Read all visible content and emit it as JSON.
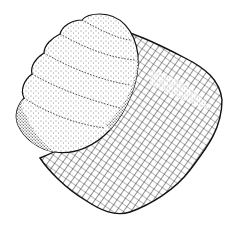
{
  "figure": {
    "background_color": "#ffffff",
    "ink_color": "#111111",
    "parts": [
      {
        "name": "ribbed-lobe",
        "texture": "stipple",
        "ridges": 5
      },
      {
        "name": "body",
        "texture": "cross-hatch"
      }
    ]
  }
}
